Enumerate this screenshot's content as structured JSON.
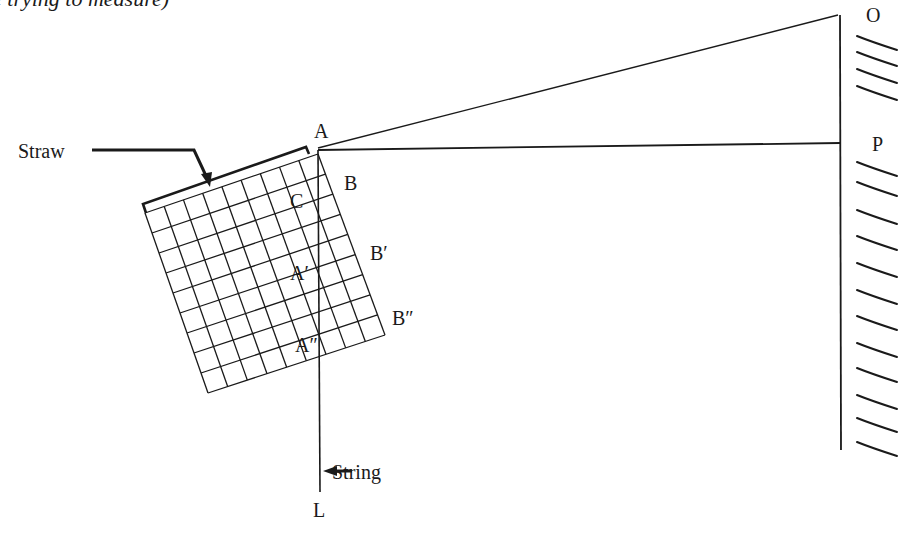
{
  "caption_fragment": "e trying to measure)",
  "labels": {
    "straw": "Straw",
    "string": "String",
    "A": "A",
    "B": "B",
    "C": "C",
    "A_prime": "A′",
    "B_prime": "B′",
    "A_double_prime": "A″",
    "B_double_prime": "B″",
    "L": "L",
    "O": "O",
    "P": "P"
  },
  "colors": {
    "ink": "#1a1a1a",
    "background": "#ffffff"
  },
  "grid": {
    "rows": 9,
    "cols": 9
  }
}
